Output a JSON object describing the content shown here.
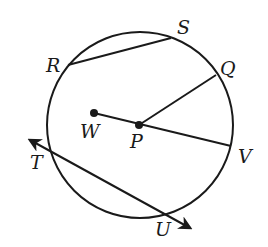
{
  "diagram": {
    "circle": {
      "cx": 140,
      "cy": 125,
      "r": 93
    },
    "points": {
      "R": {
        "label": "R",
        "x": 68,
        "y": 65
      },
      "S": {
        "label": "S",
        "x": 171,
        "y": 38
      },
      "Q": {
        "label": "Q",
        "x": 216,
        "y": 75
      },
      "V": {
        "label": "V",
        "x": 231,
        "y": 146
      },
      "W": {
        "label": "W",
        "x": 94,
        "y": 113
      },
      "P": {
        "label": "P",
        "x": 139,
        "y": 125
      },
      "T": {
        "label": "T",
        "x": 48,
        "y": 150
      },
      "U": {
        "label": "U",
        "x": 166,
        "y": 212
      }
    },
    "segments": [
      {
        "name": "chord-RS",
        "from": "R",
        "to": "S"
      },
      {
        "name": "segment-PQ",
        "from": "P",
        "to": "Q"
      },
      {
        "name": "segment-WV",
        "from": "W",
        "to": "V"
      }
    ],
    "lines": [
      {
        "name": "line-TU",
        "through": [
          "T",
          "U"
        ],
        "arrows": "both"
      }
    ]
  }
}
